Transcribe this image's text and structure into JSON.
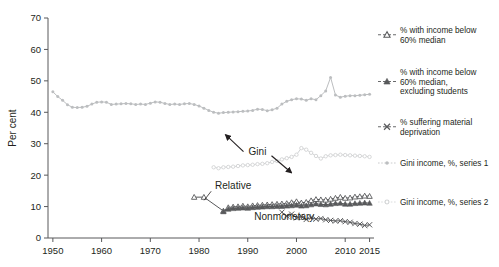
{
  "chart_data": {
    "type": "line",
    "title": "",
    "xlabel": "",
    "ylabel": "Per cent",
    "xlim": [
      1949,
      2015.5
    ],
    "ylim": [
      0,
      70
    ],
    "xticks": [
      1950,
      1960,
      1970,
      1980,
      1990,
      2000,
      2010,
      2015
    ],
    "xticklabels": [
      "1950",
      "1960",
      "1970",
      "1980",
      "1990",
      "2000",
      "2010",
      "2015"
    ],
    "yticks": [
      0,
      10,
      20,
      30,
      40,
      50,
      60,
      70
    ],
    "yticklabels": [
      "0",
      "10",
      "20",
      "30",
      "40",
      "50",
      "60",
      "70"
    ],
    "grid": false,
    "legend_position": "right",
    "annotations": [
      {
        "text": "Gini",
        "x": 1992.0,
        "y": 26.5
      },
      {
        "text": "Relative",
        "x": 1987.0,
        "y": 15.5
      },
      {
        "text": "Nonmonetary",
        "x": 1997.5,
        "y": 5.8
      }
    ],
    "series": [
      {
        "name": "% with income below 60% median",
        "marker": "open-triangle",
        "color": "#58595b",
        "x": [
          1979,
          1981,
          1985,
          1986,
          1987,
          1988,
          1989,
          1990,
          1991,
          1992,
          1993,
          1994,
          1995,
          1996,
          1997,
          1998,
          1999,
          2000,
          2001,
          2002,
          2003,
          2004,
          2005,
          2006,
          2007,
          2008,
          2009,
          2010,
          2011,
          2012,
          2013,
          2014,
          2015
        ],
        "values": [
          13.0,
          13.0,
          8.6,
          9.7,
          9.9,
          10.0,
          10.2,
          10.0,
          10.3,
          10.4,
          10.5,
          10.6,
          10.7,
          10.8,
          10.9,
          11.0,
          11.3,
          11.6,
          11.2,
          11.4,
          11.9,
          12.3,
          12.2,
          12.1,
          12.4,
          12.7,
          13.0,
          12.7,
          12.8,
          13.1,
          13.2,
          13.4,
          13.3
        ]
      },
      {
        "name": "% with income below 60% median, excluding students",
        "marker": "filled-triangle",
        "color": "#58595b",
        "x": [
          1985,
          1986,
          1987,
          1988,
          1989,
          1990,
          1991,
          1992,
          1993,
          1994,
          1995,
          1996,
          1997,
          1998,
          1999,
          2000,
          2001,
          2002,
          2003,
          2004,
          2005,
          2006,
          2007,
          2008,
          2009,
          2010,
          2011,
          2012,
          2013,
          2014,
          2015
        ],
        "values": [
          8.4,
          9.2,
          9.4,
          9.5,
          9.6,
          9.5,
          9.7,
          9.8,
          9.9,
          10.0,
          10.0,
          10.1,
          10.1,
          10.2,
          10.3,
          10.5,
          10.2,
          10.3,
          10.6,
          10.9,
          10.7,
          10.6,
          10.8,
          11.0,
          11.1,
          10.8,
          10.8,
          11.0,
          11.1,
          11.2,
          11.1
        ]
      },
      {
        "name": "% suffering material deprivation",
        "marker": "x",
        "color": "#58595b",
        "x": [
          1997,
          1998,
          1999,
          2000,
          2001,
          2002,
          2003,
          2004,
          2005,
          2006,
          2007,
          2008,
          2009,
          2010,
          2011,
          2012,
          2013,
          2014,
          2015
        ],
        "values": [
          8.2,
          7.0,
          7.6,
          6.4,
          6.9,
          5.9,
          6.5,
          6.0,
          6.2,
          5.8,
          5.6,
          5.4,
          5.5,
          5.2,
          5.0,
          4.6,
          4.4,
          4.0,
          4.2
        ]
      },
      {
        "name": "Gini income, %, series 1",
        "marker": "dot",
        "color": "#bcbec0",
        "x": [
          1950,
          1951,
          1952,
          1953,
          1954,
          1955,
          1956,
          1957,
          1958,
          1959,
          1960,
          1961,
          1962,
          1963,
          1964,
          1965,
          1966,
          1967,
          1968,
          1969,
          1970,
          1971,
          1972,
          1973,
          1974,
          1975,
          1976,
          1977,
          1978,
          1979,
          1980,
          1981,
          1982,
          1983,
          1984,
          1985,
          1986,
          1987,
          1988,
          1989,
          1990,
          1991,
          1992,
          1993,
          1994,
          1995,
          1996,
          1997,
          1998,
          1999,
          2000,
          2001,
          2002,
          2003,
          2004,
          2005,
          2006,
          2007,
          2008,
          2009,
          2010,
          2011,
          2012,
          2013,
          2014,
          2015
        ],
        "values": [
          46.5,
          45.0,
          43.8,
          42.4,
          41.6,
          41.5,
          41.6,
          41.9,
          42.6,
          43.2,
          43.3,
          43.2,
          42.5,
          42.6,
          42.7,
          42.8,
          42.7,
          42.5,
          42.6,
          42.5,
          42.9,
          43.3,
          43.2,
          42.8,
          42.5,
          42.6,
          42.5,
          42.7,
          42.8,
          42.5,
          42.0,
          41.3,
          40.6,
          40.0,
          39.7,
          39.9,
          40.0,
          40.1,
          40.2,
          40.3,
          40.4,
          40.6,
          41.0,
          40.9,
          40.5,
          40.8,
          41.3,
          42.6,
          43.5,
          44.0,
          44.3,
          44.2,
          43.8,
          44.3,
          44.0,
          45.3,
          46.8,
          51.1,
          45.5,
          44.8,
          45.1,
          45.3,
          45.3,
          45.4,
          45.6,
          45.7
        ]
      },
      {
        "name": "Gini income, %, series 2",
        "marker": "open-dot",
        "color": "#d1d3d4",
        "x": [
          1983,
          1984,
          1985,
          1986,
          1987,
          1988,
          1989,
          1990,
          1991,
          1992,
          1993,
          1994,
          1995,
          1996,
          1997,
          1998,
          1999,
          2000,
          2001,
          2002,
          2003,
          2004,
          2005,
          2006,
          2007,
          2008,
          2009,
          2010,
          2011,
          2012,
          2013,
          2014,
          2015
        ],
        "values": [
          22.5,
          22.2,
          22.5,
          22.6,
          22.7,
          22.9,
          23.1,
          23.2,
          23.3,
          23.5,
          23.6,
          23.8,
          24.2,
          24.5,
          25.0,
          25.4,
          25.8,
          26.5,
          28.6,
          28.1,
          27.1,
          26.1,
          25.3,
          26.0,
          26.3,
          26.4,
          26.5,
          26.4,
          26.3,
          26.2,
          26.1,
          26.0,
          25.8
        ]
      }
    ]
  },
  "legend": {
    "items": [
      {
        "label_lines": [
          "% with income below",
          "60% median"
        ],
        "marker": "open-triangle"
      },
      {
        "label_lines": [
          "% with income below",
          "60% median,",
          "excluding students"
        ],
        "marker": "filled-triangle"
      },
      {
        "label_lines": [
          "% suffering material",
          "deprivation"
        ],
        "marker": "x"
      },
      {
        "label_lines": [
          "Gini income, %, series 1"
        ],
        "marker": "dot"
      },
      {
        "label_lines": [
          "Gini income, %, series 2"
        ],
        "marker": "open-dot"
      }
    ]
  },
  "colors": {
    "dark": "#58595b",
    "gini1": "#bcbec0",
    "gini2": "#d1d3d4",
    "text": "#231f20",
    "background": "#ffffff"
  }
}
